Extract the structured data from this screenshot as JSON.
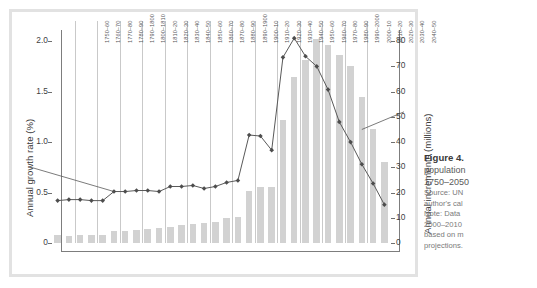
{
  "figure": {
    "caption_title": "Figure 4.",
    "caption_lines": [
      "population",
      "1750–2050"
    ],
    "notes": [
      "Source: UN",
      "author's cal",
      "Note: Data",
      "2000–2010",
      "based on m",
      "projections."
    ]
  },
  "colors": {
    "bar": "#d2d2d2",
    "line": "#595959",
    "marker": "#4d4d4d",
    "axis": "#7d7d7d",
    "grid": "#c9c9c9",
    "frame": "#e2e2e2"
  },
  "chart_data": {
    "type": "bar",
    "title": "",
    "xlabel": "",
    "ylabel": "Annual growth rate (%)",
    "y2label": "Annual increments (millions)",
    "ylim": [
      0,
      2.2
    ],
    "y2lim": [
      0,
      88
    ],
    "yticks": [
      "0",
      "0.5",
      "1.0",
      "1.5",
      "2.0"
    ],
    "ytick_values": [
      0,
      0.5,
      1.0,
      1.5,
      2.0
    ],
    "y2ticks": [
      "0",
      "10",
      "20",
      "30",
      "40",
      "50",
      "60",
      "70",
      "80"
    ],
    "y2tick_values": [
      0,
      10,
      20,
      30,
      40,
      50,
      60,
      70,
      80
    ],
    "grid": "vertical-separators",
    "legend": "none",
    "categories": [
      "1750–60",
      "1760–70",
      "1770–80",
      "1780–90",
      "1790–1800",
      "1800–1810",
      "1810–20",
      "1820–30",
      "1830–40",
      "1840–50",
      "1850–60",
      "1860–70",
      "1870–80",
      "1880–90",
      "1890–1900",
      "1900–10",
      "1910–20",
      "1920–30",
      "1930–40",
      "1940–50",
      "1950–60",
      "1960–70",
      "1970–80",
      "1980–90",
      "1990–2000",
      "2000–10",
      "2010–20",
      "2020–30",
      "2030–40",
      "2040–50"
    ],
    "series": [
      {
        "name": "Annual growth rate (%)",
        "axis": "left",
        "render": "line-markers",
        "values": [
          0.42,
          0.43,
          0.43,
          0.42,
          0.42,
          0.51,
          0.51,
          0.52,
          0.52,
          0.51,
          0.56,
          0.56,
          0.57,
          0.54,
          0.56,
          0.6,
          0.62,
          1.07,
          1.06,
          0.92,
          1.84,
          2.03,
          1.85,
          1.75,
          1.52,
          1.2,
          1.0,
          0.78,
          0.59,
          0.38
        ]
      },
      {
        "name": "Annual increments (millions)",
        "axis": "right",
        "render": "bars",
        "values": [
          3.0,
          2.8,
          3.0,
          3.0,
          3.2,
          4.6,
          4.9,
          5.0,
          5.6,
          5.8,
          6.5,
          7.2,
          7.5,
          7.8,
          8.4,
          9.8,
          10.3,
          20.8,
          22.3,
          22.4,
          48.8,
          66.0,
          72.5,
          80.8,
          78.5,
          74.5,
          70.0,
          58.0,
          45.0,
          32.0
        ]
      }
    ]
  }
}
